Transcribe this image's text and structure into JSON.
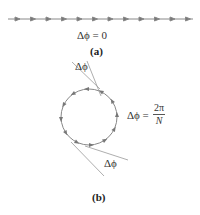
{
  "panel_a": {
    "equation": "Δϕ = 0",
    "caption": "(a)",
    "arrow_count": 12
  },
  "panel_b": {
    "equation_lhs": "Δϕ =",
    "equation_numerator": "2π",
    "equation_denominator": "N",
    "top_angle_label": "Δϕ",
    "bottom_angle_label": "Δϕ",
    "caption": "(b)",
    "arrow_count": 12
  },
  "colors": {
    "line": "#888888",
    "arrow": "#777777",
    "text": "#333333"
  }
}
